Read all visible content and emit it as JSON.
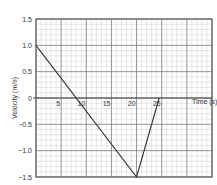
{
  "chart_data": {
    "type": "line",
    "title": "",
    "xlabel": "Time (s)",
    "ylabel": "Velocity (m/s)",
    "xlim": [
      0,
      35
    ],
    "ylim": [
      -1.5,
      1.5
    ],
    "x_ticks": [
      5,
      10,
      15,
      20,
      25
    ],
    "y_ticks": [
      1.5,
      1.0,
      0.5,
      0,
      -0.5,
      -1.0,
      -1.5
    ],
    "y_tick_labels": [
      "1.5",
      "1.0",
      "0.5",
      "0",
      "−0.5",
      "−1.0",
      "−1.5"
    ],
    "grid": true,
    "grid_minor_per_major": 5,
    "legend": null,
    "series": [
      {
        "name": "velocity",
        "x": [
          0,
          20,
          24.5
        ],
        "y": [
          1.0,
          -1.5,
          0
        ]
      }
    ]
  },
  "colors": {
    "line": "#333333",
    "major_grid": "#7a7a7a",
    "minor_grid": "#cfcfcf",
    "axis": "#444444",
    "text": "#333333"
  }
}
